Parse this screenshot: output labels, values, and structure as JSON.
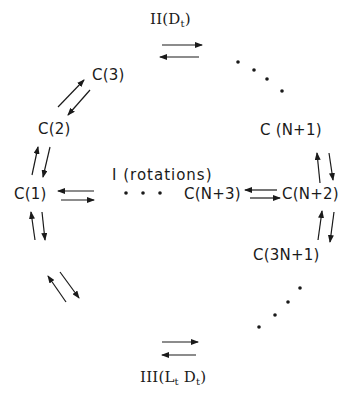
{
  "diagram": {
    "nodes": {
      "c1": "C(1)",
      "c2": "C(2)",
      "c3": "C(3)",
      "cN1": "C (N+1)",
      "cN2": "C(N+2)",
      "cN3": "C(N+3)",
      "c3N1": "C(3N+1)",
      "c2N2": "C(2N+2)",
      "c2N3": "C(2N+3)"
    },
    "groups": {
      "rotations": "I (rotations)",
      "top": {
        "prefix": "II(D",
        "sub": "t",
        "suffix": ")"
      },
      "bottom": {
        "prefix": "III(L",
        "sub1": "t",
        "mid": " D",
        "sub2": "t",
        "suffix": ")"
      }
    },
    "colors": {
      "ink": "#1a1a1a",
      "background": "#ffffff"
    }
  }
}
